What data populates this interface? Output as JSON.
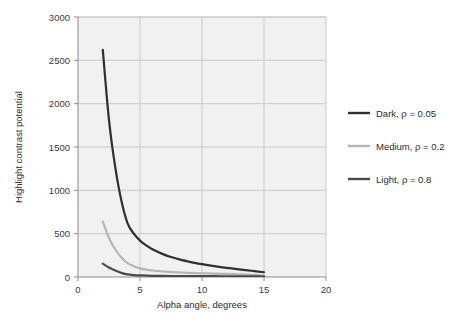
{
  "chart_data": {
    "type": "line",
    "title": "",
    "xlabel": "Alpha angle, degrees",
    "ylabel": "Highlight contrast potential",
    "xlim": [
      0,
      20
    ],
    "ylim": [
      0,
      3000
    ],
    "xticks": [
      "0",
      "5",
      "10",
      "15",
      "20"
    ],
    "xtick_values": [
      0,
      5,
      10,
      15,
      20
    ],
    "yticks": [
      "0",
      "500",
      "1000",
      "1500",
      "2000",
      "2500",
      "3000"
    ],
    "ytick_values": [
      0,
      500,
      1000,
      1500,
      2000,
      2500,
      3000
    ],
    "grid": true,
    "legend_position": "right",
    "plot_bg": "#f1f1f1",
    "grid_color": "#c9c9c9",
    "series": [
      {
        "name": "Dark, ρ = 0.05",
        "color": "#2f2f2f",
        "x": [
          2,
          2.5,
          3,
          3.5,
          4,
          4.5,
          5,
          5.5,
          6,
          6.5,
          7,
          7.5,
          8,
          9,
          10,
          11,
          12,
          13,
          14,
          15
        ],
        "values": [
          2620,
          1810,
          1270,
          880,
          620,
          500,
          420,
          365,
          320,
          285,
          255,
          230,
          210,
          175,
          148,
          125,
          105,
          88,
          72,
          55
        ]
      },
      {
        "name": "Medium, ρ = 0.2",
        "color": "#b5b5b5",
        "x": [
          2,
          2.5,
          3,
          3.5,
          4,
          4.5,
          5,
          5.5,
          6,
          6.5,
          7,
          8,
          9,
          10,
          11,
          12,
          13,
          14,
          15
        ],
        "values": [
          640,
          450,
          320,
          225,
          160,
          125,
          100,
          85,
          75,
          68,
          62,
          54,
          48,
          43,
          39,
          35,
          30,
          24,
          16
        ]
      },
      {
        "name": "Light, ρ = 0.8",
        "color": "#4a4a4a",
        "x": [
          2,
          2.5,
          3,
          3.5,
          4,
          4.5,
          5,
          6,
          7,
          8,
          9,
          10,
          11,
          12,
          13,
          14,
          15
        ],
        "values": [
          155,
          110,
          75,
          48,
          30,
          22,
          18,
          14,
          12,
          11,
          10,
          9,
          9,
          8,
          8,
          7,
          6
        ]
      }
    ]
  }
}
